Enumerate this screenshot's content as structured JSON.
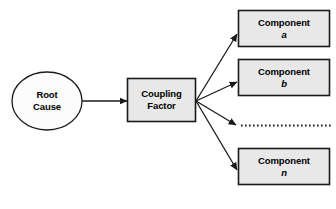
{
  "diagram": {
    "type": "flow-diagram",
    "background_color": "#ffffff",
    "stroke_color": "#1a1a1a",
    "node_fill": "#e8e8e8",
    "ellipse_fill": "#fcfcfc",
    "nodes": [
      {
        "id": "root-cause",
        "shape": "ellipse",
        "line1": "Root",
        "line2": "Cause",
        "italic_line2": false
      },
      {
        "id": "coupling-factor",
        "shape": "rect",
        "line1": "Coupling",
        "line2": "Factor",
        "italic_line2": false
      },
      {
        "id": "component-a",
        "shape": "rect",
        "line1": "Component",
        "line2": "a",
        "italic_line2": true
      },
      {
        "id": "component-b",
        "shape": "rect",
        "line1": "Component",
        "line2": "b",
        "italic_line2": true
      },
      {
        "id": "component-n",
        "shape": "rect",
        "line1": "Component",
        "line2": "n",
        "italic_line2": true
      }
    ],
    "edges": [
      {
        "id": "root-to-coupling",
        "from": "root-cause",
        "to": "coupling-factor",
        "style": "solid-arrow"
      },
      {
        "id": "coupling-to-a",
        "from": "coupling-factor",
        "to": "component-a",
        "style": "solid-arrow"
      },
      {
        "id": "coupling-to-b",
        "from": "coupling-factor",
        "to": "component-b",
        "style": "solid-arrow"
      },
      {
        "id": "coupling-to-ellipsis",
        "from": "coupling-factor",
        "to": "ellipsis",
        "style": "solid-arrow"
      },
      {
        "id": "coupling-to-n",
        "from": "coupling-factor",
        "to": "component-n",
        "style": "solid-arrow"
      }
    ],
    "ellipsis": {
      "id": "dotted-continuation",
      "style": "dotted-line"
    }
  }
}
